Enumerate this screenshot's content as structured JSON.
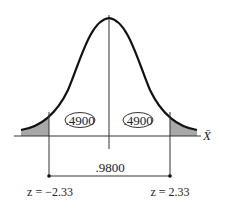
{
  "diagram": {
    "type": "normal-distribution-curve",
    "axis_label": "X̄",
    "regions": [
      {
        "name": "left-center-area",
        "value": ".4900"
      },
      {
        "name": "right-center-area",
        "value": ".4900"
      }
    ],
    "middle_area_label": ".9800",
    "critical_values": {
      "left": "z = −2.33",
      "right": "z = 2.33"
    },
    "shaded_tails": [
      "left",
      "right"
    ],
    "colors": {
      "curve": "#111111",
      "tail_fill": "#a8a8a8",
      "lines": "#333333"
    }
  }
}
